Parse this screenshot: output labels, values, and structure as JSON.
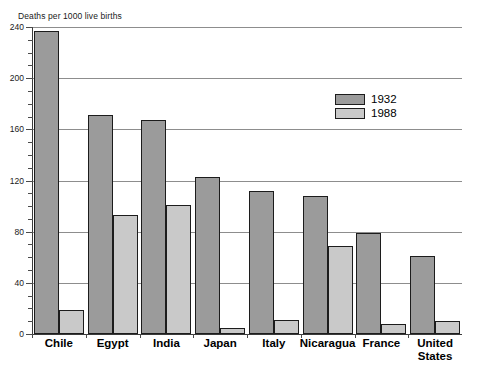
{
  "chart_data": {
    "type": "bar",
    "title": "Deaths per 1000 live births",
    "xlabel": "",
    "ylabel": "Deaths per 1000 live births",
    "ylim": [
      0,
      240
    ],
    "ytick_major_step": 40,
    "ytick_minor_step": 10,
    "grid": true,
    "grid_axis": "y",
    "legend_position": "inside-upper-right",
    "categories": [
      "Chile",
      "Egypt",
      "India",
      "Japan",
      "Italy",
      "Nicaragua",
      "France",
      "United States"
    ],
    "ytick_labels": [
      "240",
      "200",
      "160",
      "120",
      "80",
      "40",
      "0"
    ],
    "ytick_values": [
      240,
      200,
      160,
      120,
      80,
      40,
      0
    ],
    "series": [
      {
        "name": "1932",
        "color": "#9b9b9b",
        "values": [
          237,
          171,
          167,
          123,
          112,
          108,
          79,
          61
        ]
      },
      {
        "name": "1988",
        "color": "#c9c9c9",
        "values": [
          19,
          93,
          101,
          5,
          11,
          69,
          8,
          10
        ]
      }
    ]
  },
  "legend": {
    "entries": [
      {
        "label": "1932"
      },
      {
        "label": "1988"
      }
    ]
  },
  "colors": {
    "series_1932": "#9b9b9b",
    "series_1988": "#c9c9c9",
    "gridline": "#8d8d8d",
    "axis": "#3a3a3a",
    "bar_outline": "#1c1c1c",
    "background": "#ffffff"
  }
}
